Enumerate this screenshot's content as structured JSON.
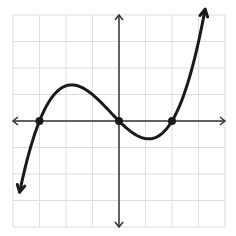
{
  "chart_data": {
    "type": "line",
    "title": "",
    "xlabel": "",
    "ylabel": "",
    "grid": true,
    "xlim": [
      -4,
      4
    ],
    "ylim": [
      -4,
      4
    ],
    "function": "f(x) = a * x * (x + 3) * (x - 2), a ≈ 0.166",
    "roots": [
      [
        -3,
        0
      ],
      [
        0,
        0
      ],
      [
        2,
        0
      ]
    ],
    "local_max": [
      -1.8,
      1.36
    ],
    "local_min": [
      1.1,
      -0.67
    ],
    "curve_range_x": [
      -3.75,
      3.25
    ],
    "end_behavior": "down-left arrow, up-right arrow",
    "marked_points": [
      [
        -3,
        0
      ],
      [
        0,
        0
      ],
      [
        2,
        0
      ]
    ],
    "colors": {
      "grid": "#dddddd",
      "axis": "#333333",
      "curve": "#1a1a1a"
    }
  }
}
